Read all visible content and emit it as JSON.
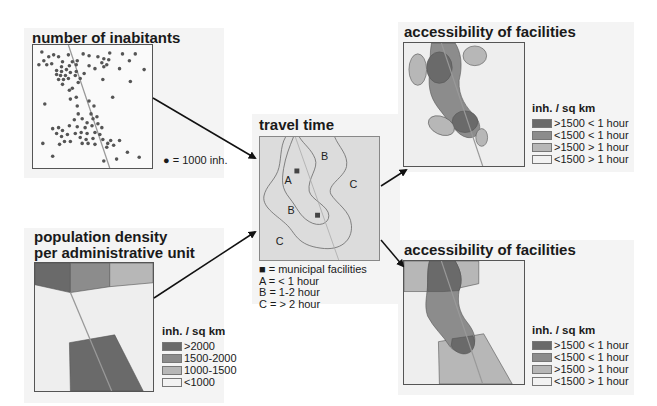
{
  "colors": {
    "darkest": "#6a6a6a",
    "dark": "#8c8c8c",
    "medium": "#b7b7b7",
    "light": "#eeeeee",
    "panel_bg": "#f4f4f4",
    "dot": "#555555",
    "road": "#999999",
    "travel_bg": "#dcdcdc"
  },
  "panels": {
    "inhabitants": {
      "title": "number of inabitants",
      "note": "● = 1000 inh."
    },
    "density": {
      "title_line1": "population density",
      "title_line2": "per administrative unit",
      "legend_title": "inh. / sq km",
      "legend": [
        ">2000",
        "1500-2000",
        "1000-1500",
        "<1000"
      ]
    },
    "travel": {
      "title": "travel time",
      "zone_labels": [
        "A",
        "B",
        "B",
        "C",
        "C"
      ],
      "legend": [
        "■ = municipal facilities",
        "A = < 1 hour",
        "B = 1-2 hour",
        "C = > 2 hour"
      ]
    },
    "access_top": {
      "title": "accessibility of facilities",
      "legend_title": "inh. / sq km",
      "legend": [
        ">1500 < 1 hour",
        "<1500 < 1 hour",
        ">1500 > 1 hour",
        "<1500 > 1 hour"
      ]
    },
    "access_bottom": {
      "title": "accessibility of facilities",
      "legend_title": "inh. / sq km",
      "legend": [
        ">1500 < 1 hour",
        "<1500 < 1 hour",
        ">1500 > 1 hour",
        "<1500 > 1 hour"
      ]
    }
  }
}
